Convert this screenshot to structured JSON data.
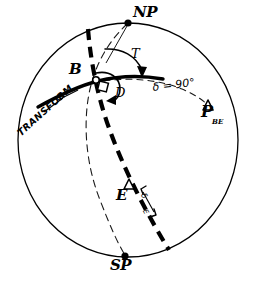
{
  "figure": {
    "type": "stereonet-projection-diagram",
    "title": "",
    "background_color": "#ffffff",
    "ink_color": "#000000",
    "width": 253,
    "height": 289
  },
  "primitive_circle": {
    "name": "primitive-circle",
    "center_x": 128,
    "center_y": 140,
    "radius": 117,
    "stroke_width": 1.2,
    "style": "solid"
  },
  "points": [
    {
      "id": "north-pole",
      "label": "NP",
      "marker": "filled-dot",
      "x": 128,
      "y": 23
    },
    {
      "id": "south-pole",
      "label": "SP",
      "marker": "filled-dot",
      "x": 125,
      "y": 256
    },
    {
      "id": "point-b",
      "label": "B",
      "marker": "open-circle",
      "x": 96,
      "y": 80
    },
    {
      "id": "pole-be",
      "label": "P",
      "sublabel": "BE",
      "marker": "open-triangle",
      "x": 208,
      "y": 108
    },
    {
      "id": "point-e",
      "label": "E",
      "marker": "open-triangle",
      "x": 128,
      "y": 184
    }
  ],
  "angles": [
    {
      "id": "angle-t",
      "label": "T",
      "description": "angle-from-north-to-transform"
    },
    {
      "id": "angle-d",
      "label": "D",
      "description": "angle-from-transform-to-great-circle"
    },
    {
      "id": "angle-delta-90",
      "label": "δ = 90°",
      "description": "angular-distance-along-small-circle"
    },
    {
      "id": "angle-delta-e",
      "label": "δ",
      "sublabel": "E",
      "description": "angular-distance-to-E"
    }
  ],
  "curves": [
    {
      "id": "transform-line",
      "label": "TRANSFORM",
      "style": "thick-solid"
    },
    {
      "id": "great-circle-be",
      "label": "",
      "style": "thick-dashed"
    },
    {
      "id": "great-circle-b-sp",
      "label": "",
      "style": "thin-dashed"
    },
    {
      "id": "small-circle-delta-90",
      "label": "δ = 90°",
      "style": "thin-dashed"
    }
  ],
  "labels": {
    "np": "NP",
    "sp": "SP",
    "b": "B",
    "e": "E",
    "t": "T",
    "d": "D",
    "p": "P",
    "p_sub": "BE",
    "delta_90": "δ = 90°",
    "transform": "TRANSFORM",
    "delta_e": "δ",
    "delta_e_sub": "E"
  }
}
